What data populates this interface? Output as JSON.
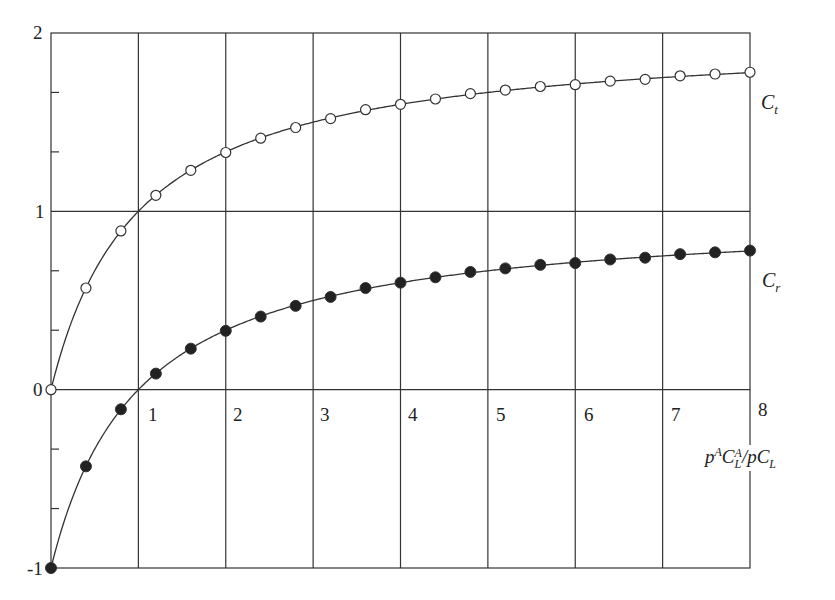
{
  "chart_data": {
    "type": "line",
    "title": "",
    "xlabel": "p^A C_L^A / p C_L",
    "ylabel": "",
    "xlim": [
      0,
      8
    ],
    "ylim": [
      -1,
      2
    ],
    "grid": true,
    "x_ticks": [
      "1",
      "2",
      "3",
      "4",
      "5",
      "6",
      "7",
      "8"
    ],
    "y_ticks": [
      "-1",
      "0",
      "1",
      "2"
    ],
    "x": [
      0,
      0.4,
      0.8,
      1.2,
      1.6,
      2.0,
      2.4,
      2.8,
      3.2,
      3.6,
      4.0,
      4.4,
      4.8,
      5.2,
      5.6,
      6.0,
      6.4,
      6.8,
      7.2,
      7.6,
      8.0
    ],
    "series": [
      {
        "name": "C_t",
        "marker": "open-circle",
        "values": [
          0.0,
          0.57,
          0.89,
          1.09,
          1.23,
          1.33,
          1.41,
          1.47,
          1.52,
          1.57,
          1.6,
          1.63,
          1.66,
          1.68,
          1.7,
          1.71,
          1.73,
          1.74,
          1.76,
          1.77,
          1.78
        ]
      },
      {
        "name": "C_r",
        "marker": "filled-circle",
        "values": [
          -1.0,
          -0.43,
          -0.11,
          0.09,
          0.23,
          0.33,
          0.41,
          0.47,
          0.52,
          0.57,
          0.6,
          0.63,
          0.66,
          0.68,
          0.7,
          0.71,
          0.73,
          0.74,
          0.76,
          0.77,
          0.78
        ]
      }
    ],
    "annotations": [
      "C_t",
      "C_r"
    ]
  },
  "labels": {
    "y2": "2",
    "y1": "1",
    "y0": "0",
    "ym1": "-1",
    "x1": "1",
    "x2": "2",
    "x3": "3",
    "x4": "4",
    "x5": "5",
    "x6": "6",
    "x7": "7",
    "x8": "8",
    "ct_main": "C",
    "ct_sub": "t",
    "cr_main": "C",
    "cr_sub": "r",
    "xaxis_p": "p",
    "xaxis_A1": "A",
    "xaxis_C": "C",
    "xaxis_A2": "A",
    "xaxis_L1": "L",
    "xaxis_slash": "/",
    "xaxis_pC": "pC",
    "xaxis_L2": "L"
  }
}
